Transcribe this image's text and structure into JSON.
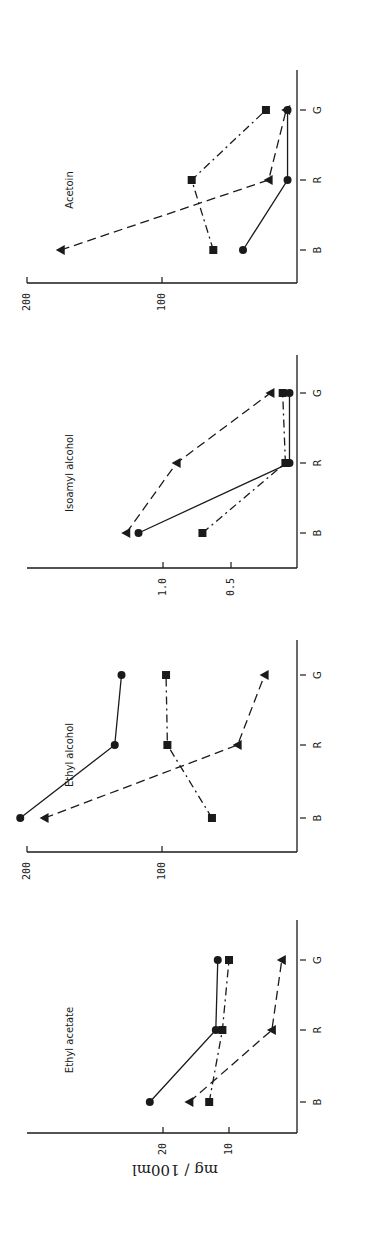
{
  "figure": {
    "ylabel": "mg / 100ml",
    "orientation": "rotated-90",
    "colors": {
      "ink": "#1a1a1a",
      "background": "#ffffff"
    }
  },
  "chart_data": [
    {
      "type": "line",
      "title": "Acetoin",
      "xlabel": "",
      "ylabel": "mg / 100ml",
      "categories": [
        "B",
        "R",
        "G"
      ],
      "yticks": [
        100,
        200
      ],
      "ytick_labels": [
        "100",
        "200"
      ],
      "ylim": [
        0,
        200
      ],
      "grid": false,
      "series": [
        {
          "name": "circle (solid line)",
          "marker": "circle",
          "linestyle": "solid",
          "values": [
            40,
            7,
            7
          ]
        },
        {
          "name": "square (dash-dot line)",
          "marker": "square",
          "linestyle": "dashdot",
          "values": [
            62,
            78,
            23
          ]
        },
        {
          "name": "triangle (dashed line)",
          "marker": "triangle",
          "linestyle": "dashed",
          "values": [
            175,
            21,
            8
          ]
        }
      ]
    },
    {
      "type": "line",
      "title": "Isoamyl alcohol",
      "xlabel": "",
      "ylabel": "mg / 100ml",
      "categories": [
        "B",
        "R",
        "G"
      ],
      "yticks": [
        0.5,
        1.0
      ],
      "ytick_labels": [
        "0.5",
        "1.0"
      ],
      "ylim": [
        0,
        2.0
      ],
      "grid": false,
      "series": [
        {
          "name": "circle (solid line)",
          "marker": "circle",
          "linestyle": "solid",
          "values": [
            1.18,
            0.07,
            0.07
          ]
        },
        {
          "name": "square (dash-dot line)",
          "marker": "square",
          "linestyle": "dashdot",
          "values": [
            0.71,
            0.1,
            0.12
          ]
        },
        {
          "name": "triangle (dashed line)",
          "marker": "triangle",
          "linestyle": "dashed",
          "values": [
            1.27,
            0.9,
            0.21
          ]
        }
      ]
    },
    {
      "type": "line",
      "title": "Ethyl alcohol",
      "xlabel": "",
      "ylabel": "mg / 100ml",
      "categories": [
        "B",
        "R",
        "G"
      ],
      "yticks": [
        100,
        200
      ],
      "ytick_labels": [
        "100",
        "200"
      ],
      "ylim": [
        0,
        200
      ],
      "grid": false,
      "series": [
        {
          "name": "circle (solid line)",
          "marker": "circle",
          "linestyle": "solid",
          "values": [
            205,
            135,
            130
          ]
        },
        {
          "name": "square (dash-dot line)",
          "marker": "square",
          "linestyle": "dashdot",
          "values": [
            63,
            96,
            97
          ]
        },
        {
          "name": "triangle (dashed line)",
          "marker": "triangle",
          "linestyle": "dashed",
          "values": [
            187,
            44,
            24
          ]
        }
      ]
    },
    {
      "type": "line",
      "title": "Ethyl acetate",
      "xlabel": "",
      "ylabel": "mg / 100ml",
      "categories": [
        "B",
        "R",
        "G"
      ],
      "yticks": [
        10,
        20
      ],
      "ytick_labels": [
        "10",
        "20"
      ],
      "ylim": [
        0,
        40
      ],
      "grid": false,
      "series": [
        {
          "name": "circle (solid line)",
          "marker": "circle",
          "linestyle": "solid",
          "values": [
            22,
            12,
            11.7
          ]
        },
        {
          "name": "square (dash-dot line)",
          "marker": "square",
          "linestyle": "dashdot",
          "values": [
            13,
            11,
            10
          ]
        },
        {
          "name": "triangle (dashed line)",
          "marker": "triangle",
          "linestyle": "dashed",
          "values": [
            16,
            3.5,
            2
          ]
        }
      ]
    }
  ]
}
